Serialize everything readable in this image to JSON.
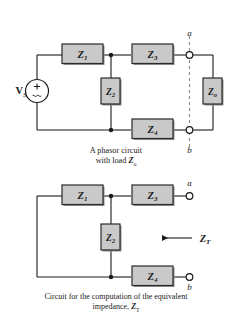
{
  "figure": {
    "title_top_caption": "A phasor circuit",
    "title_top_caption_line2_prefix": "with load ",
    "title_top_caption_line2_symbol": "Z",
    "title_top_caption_line2_sub": "o",
    "title_bottom_caption_line1": "Circuit for the computation of the equivalent",
    "title_bottom_caption_line2_prefix": "impedance, ",
    "title_bottom_caption_line2_symbol": "Z",
    "title_bottom_caption_line2_sub": "T"
  },
  "colors": {
    "background": "#ffffff",
    "wire": "#1a1a1a",
    "box_fill": "#c9c9c9",
    "box_stroke": "#2b2b2b",
    "box_shadow": "#8f8f8f",
    "node_fill": "#1a1a1a",
    "terminal_fill": "#ffffff",
    "dashed_line": "#8a8a8a",
    "text": "#1a1a1a"
  },
  "circuit_top": {
    "name": "phasor-circuit-with-load",
    "source": {
      "label_symbol": "V",
      "label_sub": "S",
      "polarity_plus": "+",
      "polarity_wave": "~"
    },
    "impedances": [
      {
        "id": "Z1",
        "symbol": "Z",
        "sub": "1",
        "orientation": "horizontal",
        "position": "top-left-branch"
      },
      {
        "id": "Z2",
        "symbol": "Z",
        "sub": "2",
        "orientation": "vertical",
        "position": "middle-shunt"
      },
      {
        "id": "Z3",
        "symbol": "Z",
        "sub": "3",
        "orientation": "horizontal",
        "position": "top-right-branch"
      },
      {
        "id": "Z4",
        "symbol": "Z",
        "sub": "4",
        "orientation": "horizontal",
        "position": "bottom-right-branch"
      },
      {
        "id": "Zo",
        "symbol": "Z",
        "sub": "o",
        "orientation": "vertical",
        "position": "load-right"
      }
    ],
    "terminals": [
      {
        "id": "a",
        "label": "a",
        "position": "top"
      },
      {
        "id": "b",
        "label": "b",
        "position": "bottom"
      }
    ]
  },
  "circuit_bottom": {
    "name": "equivalent-impedance-circuit",
    "impedances": [
      {
        "id": "Z1",
        "symbol": "Z",
        "sub": "1",
        "orientation": "horizontal",
        "position": "top-left-branch"
      },
      {
        "id": "Z2",
        "symbol": "Z",
        "sub": "2",
        "orientation": "vertical",
        "position": "middle-shunt"
      },
      {
        "id": "Z3",
        "symbol": "Z",
        "sub": "3",
        "orientation": "horizontal",
        "position": "top-right-branch"
      },
      {
        "id": "Z4",
        "symbol": "Z",
        "sub": "4",
        "orientation": "horizontal",
        "position": "bottom-right-branch"
      }
    ],
    "terminals": [
      {
        "id": "a",
        "label": "a",
        "position": "top"
      },
      {
        "id": "b",
        "label": "b",
        "position": "bottom"
      }
    ],
    "annotation": {
      "symbol": "Z",
      "sub": "T",
      "arrow_direction": "left"
    }
  }
}
